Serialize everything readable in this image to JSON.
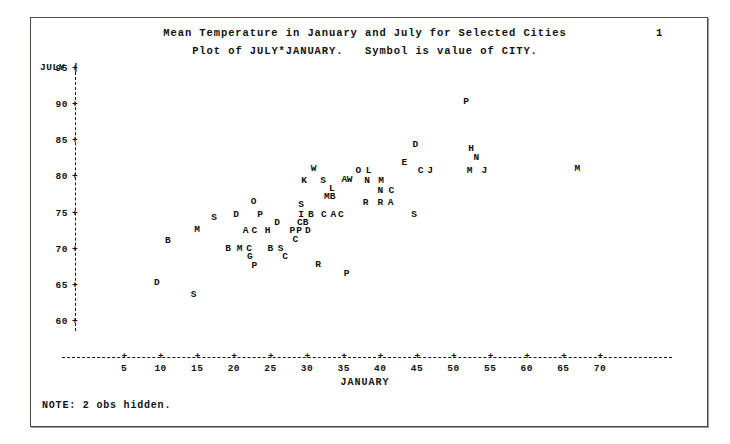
{
  "page": {
    "page_number": "1",
    "note": "NOTE: 2 obs hidden.",
    "title_line1": "Mean Temperature in January and July for Selected Cities",
    "title_line2": "Plot of JULY*JANUARY.   Symbol is value of CITY.",
    "background_color": "#ffffff",
    "text_color": "#111111",
    "frame_color": "#4a4a52"
  },
  "chart_data": {
    "type": "scatter",
    "title": "Mean Temperature in January and July for Selected Cities",
    "subtitle": "Plot of JULY*JANUARY.   Symbol is value of CITY.",
    "xlabel": "JANUARY",
    "ylabel": "JULY",
    "xlim": [
      2,
      73
    ],
    "ylim": [
      58,
      96
    ],
    "xticks": [
      5,
      10,
      15,
      20,
      25,
      30,
      35,
      40,
      45,
      50,
      55,
      60,
      65,
      70
    ],
    "yticks": [
      95,
      90,
      85,
      80,
      75,
      70,
      65,
      60
    ],
    "grid": false,
    "legend": "none",
    "symbol_meaning": "value of CITY (first letter of city name)",
    "hidden_obs": 2,
    "points": [
      {
        "symbol": "D",
        "x": 9.5,
        "y": 65.3
      },
      {
        "symbol": "B",
        "x": 11.0,
        "y": 71.0
      },
      {
        "symbol": "S",
        "x": 14.5,
        "y": 63.6
      },
      {
        "symbol": "M",
        "x": 15.0,
        "y": 72.6
      },
      {
        "symbol": "S",
        "x": 17.3,
        "y": 74.2
      },
      {
        "symbol": "B",
        "x": 19.2,
        "y": 70.0
      },
      {
        "symbol": "D",
        "x": 20.3,
        "y": 74.6
      },
      {
        "symbol": "M",
        "x": 20.8,
        "y": 70.0
      },
      {
        "symbol": "A",
        "x": 21.6,
        "y": 72.4
      },
      {
        "symbol": "C",
        "x": 22.1,
        "y": 70.0
      },
      {
        "symbol": "G",
        "x": 22.2,
        "y": 68.8
      },
      {
        "symbol": "C",
        "x": 22.8,
        "y": 72.4
      },
      {
        "symbol": "P",
        "x": 22.8,
        "y": 67.6
      },
      {
        "symbol": "O",
        "x": 22.7,
        "y": 76.5
      },
      {
        "symbol": "P",
        "x": 23.6,
        "y": 74.6
      },
      {
        "symbol": "H",
        "x": 24.6,
        "y": 72.4
      },
      {
        "symbol": "B",
        "x": 25.0,
        "y": 70.0
      },
      {
        "symbol": "D",
        "x": 25.9,
        "y": 73.5
      },
      {
        "symbol": "S",
        "x": 26.4,
        "y": 70.0
      },
      {
        "symbol": "C",
        "x": 27.0,
        "y": 68.8
      },
      {
        "symbol": "C",
        "x": 28.4,
        "y": 71.2
      },
      {
        "symbol": "P",
        "x": 28.0,
        "y": 72.4
      },
      {
        "symbol": "P",
        "x": 28.9,
        "y": 72.4
      },
      {
        "symbol": "C",
        "x": 29.0,
        "y": 73.5
      },
      {
        "symbol": "B",
        "x": 29.8,
        "y": 73.5
      },
      {
        "symbol": "S",
        "x": 29.2,
        "y": 76.0
      },
      {
        "symbol": "I",
        "x": 29.2,
        "y": 74.7
      },
      {
        "symbol": "K",
        "x": 29.6,
        "y": 79.3
      },
      {
        "symbol": "D",
        "x": 30.1,
        "y": 72.4
      },
      {
        "symbol": "B",
        "x": 30.5,
        "y": 74.7
      },
      {
        "symbol": "W",
        "x": 30.9,
        "y": 81.0
      },
      {
        "symbol": "S",
        "x": 32.2,
        "y": 79.3
      },
      {
        "symbol": "C",
        "x": 32.3,
        "y": 74.7
      },
      {
        "symbol": "M",
        "x": 32.7,
        "y": 77.2
      },
      {
        "symbol": "L",
        "x": 33.4,
        "y": 78.2
      },
      {
        "symbol": "B",
        "x": 33.5,
        "y": 77.2
      },
      {
        "symbol": "A",
        "x": 33.6,
        "y": 74.7
      },
      {
        "symbol": "C",
        "x": 34.6,
        "y": 74.7
      },
      {
        "symbol": "R",
        "x": 31.5,
        "y": 67.8
      },
      {
        "symbol": "A",
        "x": 35.1,
        "y": 79.5
      },
      {
        "symbol": "W",
        "x": 35.8,
        "y": 79.5
      },
      {
        "symbol": "O",
        "x": 37.0,
        "y": 80.8
      },
      {
        "symbol": "L",
        "x": 38.4,
        "y": 80.8
      },
      {
        "symbol": "N",
        "x": 38.2,
        "y": 79.4
      },
      {
        "symbol": "R",
        "x": 38.0,
        "y": 76.3
      },
      {
        "symbol": "P",
        "x": 35.4,
        "y": 66.5
      },
      {
        "symbol": "M",
        "x": 40.1,
        "y": 79.4
      },
      {
        "symbol": "N",
        "x": 40.0,
        "y": 78.0
      },
      {
        "symbol": "R",
        "x": 40.0,
        "y": 76.3
      },
      {
        "symbol": "C",
        "x": 41.5,
        "y": 78.0
      },
      {
        "symbol": "A",
        "x": 41.4,
        "y": 76.3
      },
      {
        "symbol": "D",
        "x": 44.8,
        "y": 84.3
      },
      {
        "symbol": "E",
        "x": 43.3,
        "y": 81.8
      },
      {
        "symbol": "C",
        "x": 45.5,
        "y": 80.7
      },
      {
        "symbol": "J",
        "x": 46.8,
        "y": 80.7
      },
      {
        "symbol": "S",
        "x": 44.6,
        "y": 74.7
      },
      {
        "symbol": "P",
        "x": 51.7,
        "y": 90.3
      },
      {
        "symbol": "H",
        "x": 52.4,
        "y": 83.8
      },
      {
        "symbol": "N",
        "x": 53.1,
        "y": 82.5
      },
      {
        "symbol": "M",
        "x": 52.2,
        "y": 80.8
      },
      {
        "symbol": "J",
        "x": 54.2,
        "y": 80.8
      },
      {
        "symbol": "M",
        "x": 66.9,
        "y": 81.0
      }
    ]
  },
  "axes": {
    "y_axis_label": "JULY",
    "y_axis_bar": "|",
    "x_axis_label": "JANUARY",
    "tick_symbol": "+",
    "y_tick_labels": [
      "95",
      "90",
      "85",
      "80",
      "75",
      "70",
      "65",
      "60"
    ],
    "x_tick_labels": [
      "5",
      "10",
      "15",
      "20",
      "25",
      "30",
      "35",
      "40",
      "45",
      "50",
      "55",
      "60",
      "65",
      "70"
    ]
  }
}
